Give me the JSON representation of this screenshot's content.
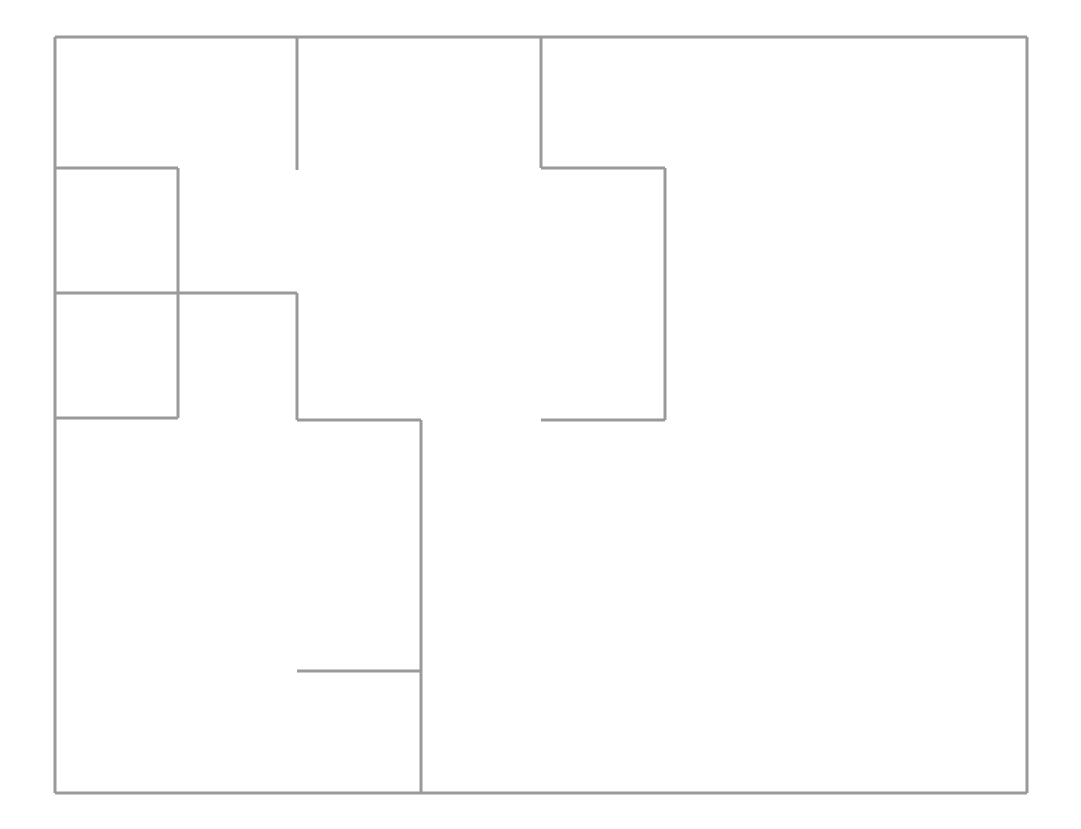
{
  "document": {
    "type": "architectural-floor-plan",
    "title": "Floor Plan",
    "canvas_width": 1081,
    "canvas_height": 829,
    "background_color": "#ffffff"
  },
  "style": {
    "wall_color": "#9a9a9a",
    "wall_thickness": 3,
    "exterior_wall_thickness": 3
  },
  "extents": {
    "left": 55,
    "top": 37,
    "right": 1027,
    "bottom": 793,
    "width": 972,
    "height": 756
  },
  "walls": [
    {
      "name": "exterior-wall-top",
      "kind": "exterior",
      "orientation": "horizontal",
      "x1": 55,
      "y1": 37,
      "x2": 1027,
      "y2": 37
    },
    {
      "name": "exterior-wall-right",
      "kind": "exterior",
      "orientation": "vertical",
      "x1": 1027,
      "y1": 37,
      "x2": 1027,
      "y2": 793
    },
    {
      "name": "exterior-wall-bottom",
      "kind": "exterior",
      "orientation": "horizontal",
      "x1": 55,
      "y1": 793,
      "x2": 1027,
      "y2": 793
    },
    {
      "name": "exterior-wall-left",
      "kind": "exterior",
      "orientation": "vertical",
      "x1": 55,
      "y1": 37,
      "x2": 55,
      "y2": 793
    },
    {
      "name": "interior-wall-top-stub-vertical",
      "kind": "interior",
      "orientation": "vertical",
      "x1": 297,
      "y1": 37,
      "x2": 297,
      "y2": 170
    },
    {
      "name": "interior-wall-upper-right-vertical",
      "kind": "interior",
      "orientation": "vertical",
      "x1": 541,
      "y1": 37,
      "x2": 541,
      "y2": 168
    },
    {
      "name": "interior-wall-upper-right-horizontal",
      "kind": "interior",
      "orientation": "horizontal",
      "x1": 541,
      "y1": 168,
      "x2": 665,
      "y2": 168
    },
    {
      "name": "interior-wall-right-room-vertical",
      "kind": "interior",
      "orientation": "vertical",
      "x1": 665,
      "y1": 168,
      "x2": 665,
      "y2": 420
    },
    {
      "name": "interior-wall-right-room-bottom",
      "kind": "interior",
      "orientation": "horizontal",
      "x1": 541,
      "y1": 420,
      "x2": 665,
      "y2": 420
    },
    {
      "name": "interior-wall-left-upper-room-top",
      "kind": "interior",
      "orientation": "horizontal",
      "x1": 55,
      "y1": 168,
      "x2": 178,
      "y2": 168
    },
    {
      "name": "interior-wall-left-rooms-divider-vertical",
      "kind": "interior",
      "orientation": "vertical",
      "x1": 178,
      "y1": 168,
      "x2": 178,
      "y2": 418
    },
    {
      "name": "interior-wall-left-rooms-middle-horizontal",
      "kind": "interior",
      "orientation": "horizontal",
      "x1": 55,
      "y1": 293,
      "x2": 297,
      "y2": 293
    },
    {
      "name": "interior-wall-center-vertical",
      "kind": "interior",
      "orientation": "vertical",
      "x1": 297,
      "y1": 293,
      "x2": 297,
      "y2": 420
    },
    {
      "name": "interior-wall-left-lower-room-bottom",
      "kind": "interior",
      "orientation": "horizontal",
      "x1": 55,
      "y1": 418,
      "x2": 178,
      "y2": 418
    },
    {
      "name": "interior-wall-center-horizontal",
      "kind": "interior",
      "orientation": "horizontal",
      "x1": 297,
      "y1": 420,
      "x2": 421,
      "y2": 420
    },
    {
      "name": "interior-wall-main-vertical",
      "kind": "interior",
      "orientation": "vertical",
      "x1": 421,
      "y1": 420,
      "x2": 421,
      "y2": 793
    },
    {
      "name": "interior-wall-lower-stub-horizontal",
      "kind": "interior",
      "orientation": "horizontal",
      "x1": 297,
      "y1": 671,
      "x2": 421,
      "y2": 671
    }
  ],
  "rooms": [
    {
      "name": "room-left-upper",
      "x": 55,
      "y": 168,
      "width": 123,
      "height": 125
    },
    {
      "name": "room-left-lower",
      "x": 55,
      "y": 293,
      "width": 123,
      "height": 125
    },
    {
      "name": "room-upper-left-large",
      "x": 55,
      "y": 37,
      "width": 242,
      "height": 131
    },
    {
      "name": "room-upper-center",
      "x": 297,
      "y": 37,
      "width": 244,
      "height": 256
    },
    {
      "name": "room-right-upper",
      "x": 541,
      "y": 37,
      "width": 486,
      "height": 131
    },
    {
      "name": "room-center-block",
      "x": 541,
      "y": 168,
      "width": 124,
      "height": 252
    },
    {
      "name": "room-lower-left-large",
      "x": 55,
      "y": 418,
      "width": 366,
      "height": 375
    },
    {
      "name": "room-lower-right-large",
      "x": 421,
      "y": 420,
      "width": 606,
      "height": 373
    }
  ]
}
